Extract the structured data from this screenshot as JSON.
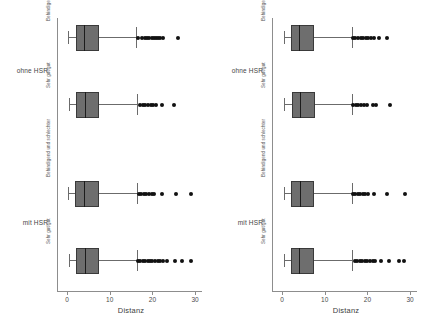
{
  "chart_data": {
    "type": "box",
    "title": "",
    "xlabel": "Distanz",
    "ylabel": "",
    "xlim": [
      -1.5,
      31.5
    ],
    "xticks": [
      0,
      10,
      20,
      30
    ],
    "xticklabels": [
      "0",
      "10",
      "20",
      "30"
    ],
    "grid": false,
    "legend": null,
    "orientation": "horizontal",
    "panels": [
      {
        "name": "panel-left",
        "groups": [
          {
            "label": "ohne HSR",
            "categories": [
              {
                "label": "Behindigend und schlechter",
                "stats": {
                  "whisker_low": 0.3,
                  "q1": 2.0,
                  "median": 4.0,
                  "q3": 7.4,
                  "whisker_high": 16.2
                },
                "outliers": [
                  16.6,
                  17.6,
                  18.3,
                  18.8,
                  19.3,
                  19.8,
                  20.3,
                  20.8,
                  21.3,
                  21.8,
                  22.4,
                  25.9
                ]
              },
              {
                "label": "Sehr gut/gut",
                "stats": {
                  "whisker_low": 0.4,
                  "q1": 2.0,
                  "median": 4.1,
                  "q3": 7.6,
                  "whisker_high": 16.4
                },
                "outliers": [
                  17.1,
                  17.7,
                  18.3,
                  19.0,
                  19.6,
                  20.2,
                  20.9,
                  22.2,
                  25.0
                ]
              }
            ]
          },
          {
            "label": "mit HSR",
            "categories": [
              {
                "label": "Behindigend und schlechter",
                "stats": {
                  "whisker_low": 0.3,
                  "q1": 1.9,
                  "median": 4.0,
                  "q3": 7.5,
                  "whisker_high": 16.3
                },
                "outliers": [
                  16.8,
                  17.4,
                  18.0,
                  18.6,
                  19.2,
                  19.8,
                  20.4,
                  22.3,
                  25.6,
                  29.0
                ]
              },
              {
                "label": "Sehr gut/gut",
                "stats": {
                  "whisker_low": 0.4,
                  "q1": 2.0,
                  "median": 4.1,
                  "q3": 7.5,
                  "whisker_high": 16.3
                },
                "outliers": [
                  16.7,
                  17.2,
                  17.8,
                  18.3,
                  18.9,
                  19.4,
                  20.0,
                  20.6,
                  21.2,
                  21.8,
                  22.4,
                  23.5,
                  25.3,
                  27.0,
                  29.0
                ]
              }
            ]
          }
        ]
      },
      {
        "name": "panel-right",
        "groups": [
          {
            "label": "ohne HSR",
            "categories": [
              {
                "label": "Behindigend und schlechter",
                "stats": {
                  "whisker_low": 0.4,
                  "q1": 2.1,
                  "median": 4.0,
                  "q3": 7.5,
                  "whisker_high": 16.3
                },
                "outliers": [
                  16.7,
                  17.2,
                  17.8,
                  18.4,
                  19.0,
                  19.6,
                  20.2,
                  20.8,
                  21.5,
                  22.6,
                  24.7
                ]
              },
              {
                "label": "Sehr gut/gut",
                "stats": {
                  "whisker_low": 0.5,
                  "q1": 2.3,
                  "median": 4.2,
                  "q3": 7.7,
                  "whisker_high": 16.4
                },
                "outliers": [
                  16.6,
                  17.3,
                  17.9,
                  18.6,
                  19.3,
                  20.0,
                  21.3,
                  21.9,
                  25.2
                ]
              }
            ]
          },
          {
            "label": "mit HSR",
            "categories": [
              {
                "label": "Behindigend und schlechter",
                "stats": {
                  "whisker_low": 0.4,
                  "q1": 2.0,
                  "median": 4.1,
                  "q3": 7.6,
                  "whisker_high": 16.3
                },
                "outliers": [
                  16.6,
                  17.1,
                  17.7,
                  18.3,
                  18.9,
                  19.5,
                  20.1,
                  21.5,
                  24.7,
                  28.7
                ]
              },
              {
                "label": "Sehr gut/gut",
                "stats": {
                  "whisker_low": 0.5,
                  "q1": 2.1,
                  "median": 4.0,
                  "q3": 7.6,
                  "whisker_high": 16.3
                },
                "outliers": [
                  17.0,
                  17.6,
                  18.2,
                  18.8,
                  19.4,
                  20.0,
                  20.6,
                  21.2,
                  21.8,
                  23.1,
                  25.0,
                  27.5,
                  28.6
                ]
              }
            ]
          }
        ]
      }
    ]
  },
  "axis": {
    "title": "Distanz"
  },
  "colors": {
    "box_fill": "#6e6e6e",
    "box_edge": "#3a3a3a",
    "median": "#1c1c1c",
    "whisker": "#6b6b6b",
    "outlier": "#111111",
    "axis": "#8d8d8d",
    "text": "#4a4a4a",
    "background": "#ffffff"
  }
}
